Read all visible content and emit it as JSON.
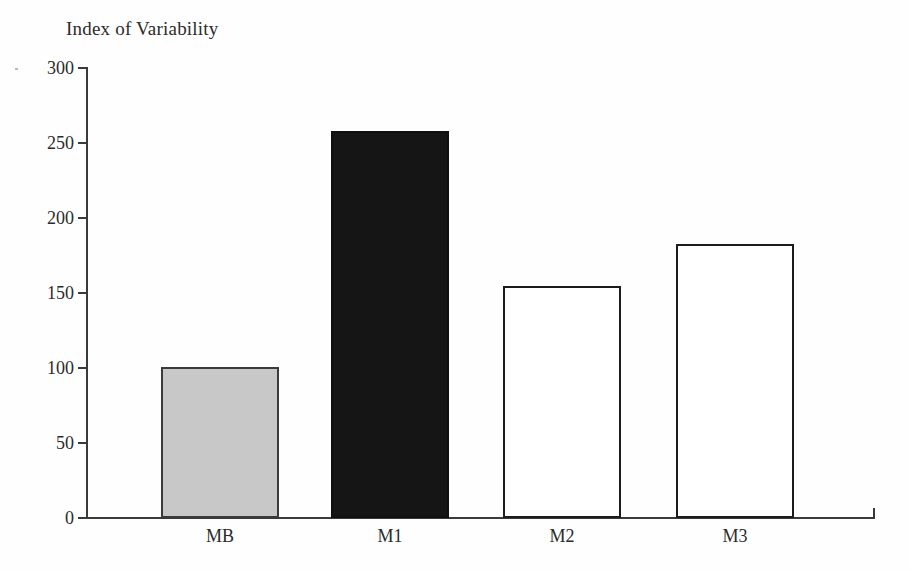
{
  "figure": {
    "background_color": "#fefefe",
    "width": 911,
    "height": 571
  },
  "chart_data": {
    "type": "bar",
    "title": "Index of Variability",
    "xlabel": "",
    "ylabel": "",
    "categories": [
      "MB",
      "M1",
      "M2",
      "M3"
    ],
    "values": [
      101,
      258,
      155,
      183
    ],
    "ylim": [
      0,
      300
    ],
    "yticks": [
      0,
      50,
      100,
      150,
      200,
      250,
      300
    ],
    "ytick_labels": [
      "0",
      "50",
      "100",
      "150",
      "200",
      "250",
      "300"
    ],
    "grid": false,
    "legend": null,
    "bar_styles": [
      {
        "category": "MB",
        "fill": "#c8c8c8",
        "edge": "#3b3b3b",
        "style": "gray"
      },
      {
        "category": "M1",
        "fill": "#151515",
        "edge": "#101010",
        "style": "black"
      },
      {
        "category": "M2",
        "fill": "#ffffff",
        "edge": "#1c1c1c",
        "style": "white"
      },
      {
        "category": "M3",
        "fill": "#ffffff",
        "edge": "#1c1c1c",
        "style": "white"
      }
    ]
  },
  "axes": {
    "axis_color": "#3a3a3a",
    "tick_label_color": "#2b2b2b"
  }
}
